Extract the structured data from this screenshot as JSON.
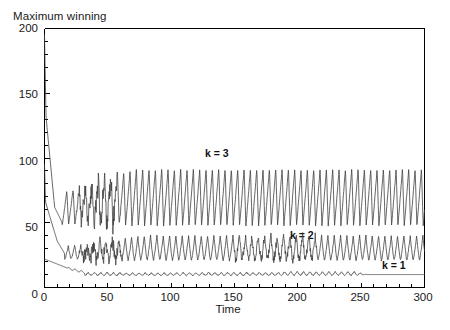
{
  "chart_data": {
    "type": "line",
    "title": "",
    "ylabel": "Maximum winning",
    "xlabel": "Time",
    "xlim": [
      0,
      300
    ],
    "ylim": [
      0,
      200
    ],
    "xticks": [
      0,
      50,
      100,
      150,
      200,
      250,
      300
    ],
    "xtick_labels": [
      "0",
      "50",
      "100",
      "150",
      "200",
      "250",
      "300"
    ],
    "yticks": [
      0,
      50,
      100,
      150,
      200
    ],
    "ytick_labels": [
      "0",
      "50",
      "100",
      "150",
      "200"
    ],
    "x_minor_tick_step": 10,
    "y_minor_tick_step": 10,
    "grid": false,
    "legend_position": "inline-annotations",
    "line_color": "#404040",
    "axis_color": "#000000",
    "background": "#ffffff",
    "series": [
      {
        "name": "k = 3",
        "label": "k = 3",
        "label_x": 120,
        "label_y": 103,
        "description": "Starts near 195 at t=0, decays rapidly, then settles into large sustained oscillations between about 48 and 92.",
        "start_value": 195,
        "steady_min": 48,
        "steady_max": 92,
        "period": 5.0
      },
      {
        "name": "k = 2",
        "label": "k = 2",
        "label_x": 196,
        "label_y": 42,
        "description": "Starts near 95 at t=0, decays to roughly 25, then oscillates between about 20 and 40.",
        "start_value": 95,
        "steady_min": 20,
        "steady_max": 40,
        "period": 5.0
      },
      {
        "name": "k = 1",
        "label": "k = 1",
        "label_x": 262,
        "label_y": 20,
        "description": "Starts near 22 at t=0, decays slowly to about 11 with small ripples, flattens to a constant near 10 after t=255.",
        "start_value": 22,
        "steady_min": 8,
        "steady_max": 14,
        "period": 5.0,
        "flat_after": 255,
        "flat_value": 10
      }
    ]
  },
  "figure": {
    "ylabel": "Maximum winning",
    "xlabel": "Time",
    "ytick_labels": [
      "200",
      "150",
      "100",
      "50",
      "0"
    ],
    "xtick_labels": [
      "0",
      "50",
      "100",
      "150",
      "200",
      "250",
      "300"
    ],
    "annot_k3": "k = 3",
    "annot_k2": "k = 2",
    "annot_k1": "k = 1"
  }
}
